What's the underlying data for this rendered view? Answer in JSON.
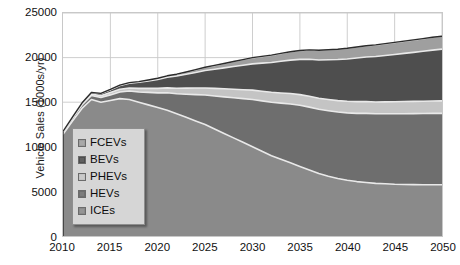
{
  "chart_data": {
    "type": "area",
    "stacked": true,
    "title": "",
    "xlabel": "",
    "ylabel": "Vehicle Sales (1000s/yr)",
    "xlim": [
      2010,
      2050
    ],
    "ylim": [
      0,
      25000
    ],
    "xticks": [
      2010,
      2015,
      2020,
      2025,
      2030,
      2035,
      2040,
      2045,
      2050
    ],
    "yticks": [
      0,
      5000,
      10000,
      15000,
      20000,
      25000
    ],
    "grid": true,
    "legend_position": "center-left inside plot",
    "x": [
      2010,
      2011,
      2012,
      2013,
      2014,
      2015,
      2016,
      2017,
      2018,
      2019,
      2020,
      2021,
      2022,
      2023,
      2024,
      2025,
      2026,
      2027,
      2028,
      2029,
      2030,
      2031,
      2032,
      2033,
      2034,
      2035,
      2036,
      2037,
      2038,
      2039,
      2040,
      2041,
      2042,
      2043,
      2044,
      2045,
      2046,
      2047,
      2048,
      2049,
      2050
    ],
    "series": [
      {
        "name": "ICEs",
        "color": "#8a8a8a",
        "stack_order": 1,
        "values": [
          11400,
          12900,
          14300,
          15300,
          15000,
          15200,
          15400,
          15300,
          15000,
          14700,
          14400,
          14100,
          13700,
          13300,
          12900,
          12500,
          12000,
          11500,
          11000,
          10500,
          10000,
          9500,
          9000,
          8600,
          8200,
          7800,
          7400,
          7000,
          6700,
          6450,
          6250,
          6100,
          6000,
          5900,
          5850,
          5800,
          5780,
          5760,
          5750,
          5750,
          5750
        ]
      },
      {
        "name": "HEVs",
        "color": "#6e6e6e",
        "stack_order": 2,
        "values": [
          250,
          300,
          380,
          450,
          520,
          620,
          750,
          950,
          1150,
          1400,
          1650,
          1950,
          2250,
          2600,
          2950,
          3300,
          3700,
          4100,
          4500,
          4900,
          5300,
          5650,
          6000,
          6300,
          6600,
          6850,
          7050,
          7200,
          7350,
          7450,
          7550,
          7650,
          7750,
          7800,
          7850,
          7900,
          7930,
          7960,
          7980,
          8000,
          8000
        ]
      },
      {
        "name": "PHEVs",
        "color": "#c4c4c4",
        "stack_order": 3,
        "values": [
          40,
          70,
          110,
          160,
          210,
          260,
          300,
          350,
          400,
          450,
          500,
          560,
          620,
          680,
          740,
          800,
          850,
          900,
          950,
          1000,
          1050,
          1080,
          1110,
          1140,
          1170,
          1200,
          1220,
          1240,
          1260,
          1280,
          1300,
          1310,
          1320,
          1330,
          1340,
          1350,
          1360,
          1370,
          1380,
          1390,
          1400
        ]
      },
      {
        "name": "BEVs",
        "color": "#4e4e4e",
        "stack_order": 4,
        "values": [
          30,
          60,
          110,
          170,
          240,
          320,
          420,
          540,
          680,
          840,
          1000,
          1180,
          1360,
          1550,
          1750,
          1950,
          2150,
          2350,
          2550,
          2750,
          2950,
          3150,
          3350,
          3550,
          3750,
          3950,
          4150,
          4300,
          4450,
          4600,
          4750,
          4900,
          5000,
          5100,
          5200,
          5300,
          5400,
          5500,
          5600,
          5700,
          5800
        ]
      },
      {
        "name": "FCEVs",
        "color": "#9f9f9f",
        "stack_order": 5,
        "values": [
          0,
          0,
          5,
          10,
          20,
          30,
          45,
          60,
          80,
          100,
          130,
          170,
          210,
          260,
          310,
          370,
          430,
          490,
          560,
          630,
          700,
          760,
          820,
          880,
          940,
          1000,
          1040,
          1080,
          1120,
          1160,
          1200,
          1230,
          1260,
          1290,
          1320,
          1350,
          1380,
          1400,
          1420,
          1440,
          1450
        ]
      }
    ],
    "totals": [
      11720,
      13330,
      14905,
      16090,
      15990,
      16430,
      16915,
      17200,
      17310,
      17490,
      17680,
      17960,
      18140,
      18390,
      18650,
      18920,
      19130,
      19340,
      19560,
      19780,
      20000,
      20140,
      20280,
      20470,
      20660,
      20800,
      20860,
      20820,
      20880,
      20940,
      21050,
      21190,
      21330,
      21420,
      21560,
      21700,
      21850,
      21990,
      22130,
      22280,
      22400
    ]
  },
  "axes": {
    "y_title": "Vehicle Sales (1000s/yr)",
    "y_tick_labels": [
      "25000",
      "20000",
      "15000",
      "10000",
      "5000",
      "0"
    ],
    "x_tick_labels": [
      "2010",
      "2015",
      "2020",
      "2025",
      "2030",
      "2035",
      "2040",
      "2045",
      "2050"
    ]
  },
  "legend": {
    "items": [
      {
        "label": "FCEVs",
        "color": "#9f9f9f"
      },
      {
        "label": "BEVs",
        "color": "#4e4e4e"
      },
      {
        "label": "PHEVs",
        "color": "#c4c4c4"
      },
      {
        "label": "HEVs",
        "color": "#6e6e6e"
      },
      {
        "label": "ICEs",
        "color": "#8a8a8a"
      }
    ]
  },
  "style": {
    "background": "#ffffff",
    "grid_color": "#c8c8c8",
    "axis_text_color": "#111111",
    "legend_background": "#d6d6d6",
    "legend_border": "#8e8e8e"
  }
}
